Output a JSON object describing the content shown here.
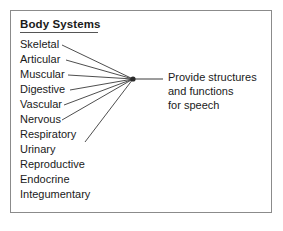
{
  "figure": {
    "title": "Body Systems",
    "border_color": "#8b8b8b",
    "text_color": "#1a1a1a",
    "line_color": "#3a3a3a",
    "background": "#ffffff"
  },
  "systems": [
    {
      "label": "Skeletal",
      "connected": true
    },
    {
      "label": "Articular",
      "connected": true
    },
    {
      "label": "Muscular",
      "connected": true
    },
    {
      "label": "Digestive",
      "connected": true
    },
    {
      "label": "Vascular",
      "connected": true
    },
    {
      "label": "Nervous",
      "connected": true
    },
    {
      "label": "Respiratory",
      "connected": true
    },
    {
      "label": "Urinary",
      "connected": false
    },
    {
      "label": "Reproductive",
      "connected": false
    },
    {
      "label": "Endocrine",
      "connected": false
    },
    {
      "label": "Integumentary",
      "connected": false
    }
  ],
  "outcome": {
    "lines": [
      "Provide structures",
      "and functions",
      "for speech"
    ]
  },
  "geometry": {
    "hub_x": 133,
    "hub_y": 79,
    "connector_end_x": 163,
    "edges": [
      {
        "x": 62,
        "y": 45
      },
      {
        "x": 66,
        "y": 60
      },
      {
        "x": 68,
        "y": 75
      },
      {
        "x": 70,
        "y": 90
      },
      {
        "x": 64,
        "y": 105
      },
      {
        "x": 62,
        "y": 120
      },
      {
        "x": 85,
        "y": 142
      }
    ]
  }
}
